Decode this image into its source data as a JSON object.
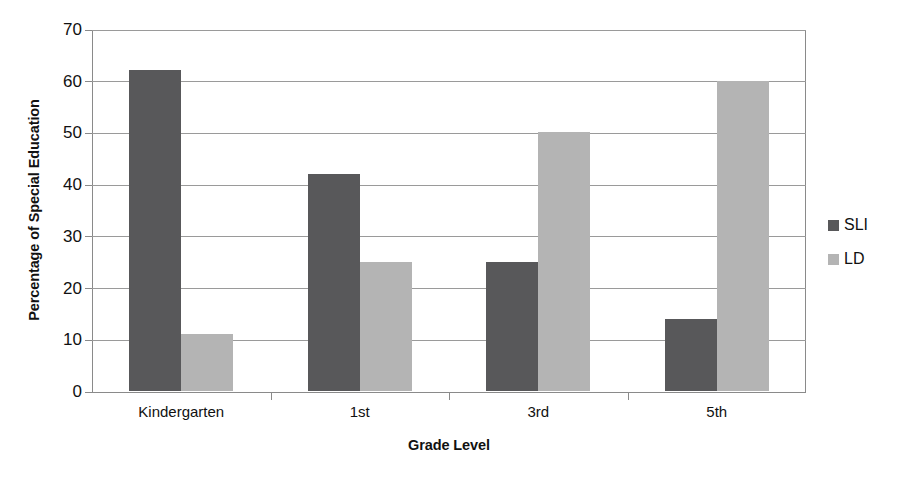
{
  "chart_data": {
    "type": "bar",
    "title": "",
    "xlabel": "Grade Level",
    "ylabel": "Percentage of Special Education",
    "categories": [
      "Kindergarten",
      "1st",
      "3rd",
      "5th"
    ],
    "series": [
      {
        "name": "SLI",
        "color": "#58585a",
        "values": [
          62,
          42,
          25,
          14
        ]
      },
      {
        "name": "LD",
        "color": "#b4b4b4",
        "values": [
          11,
          25,
          50,
          60
        ]
      }
    ],
    "ylim": [
      0,
      70
    ],
    "ytick_values": [
      0,
      10,
      20,
      30,
      40,
      50,
      60,
      70
    ],
    "ytick_labels": [
      "0",
      "10",
      "20",
      "30",
      "40",
      "50",
      "60",
      "70"
    ],
    "grid": true,
    "legend_position": "right",
    "background_color": "#ffffff",
    "axis_color": "#8a8a8a",
    "grid_color": "#9a9a9a"
  }
}
